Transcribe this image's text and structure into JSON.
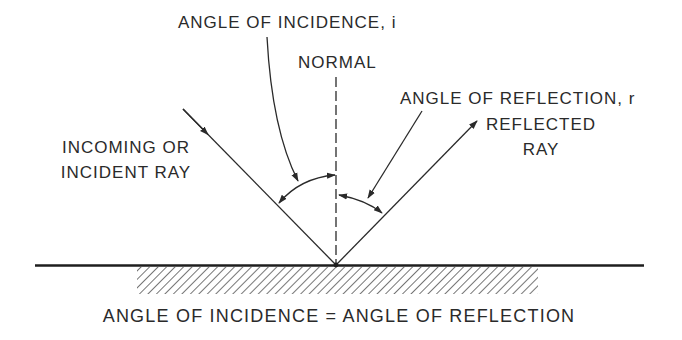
{
  "diagram": {
    "type": "law-of-reflection",
    "labels": {
      "angle_of_incidence": "ANGLE OF INCIDENCE, i",
      "normal": "NORMAL",
      "angle_of_reflection": "ANGLE OF REFLECTION, r",
      "reflected_ray_line1": "REFLECTED",
      "reflected_ray_line2": "RAY",
      "incident_ray_line1": "INCOMING OR",
      "incident_ray_line2": "INCIDENT RAY",
      "caption": "ANGLE OF INCIDENCE = ANGLE OF REFLECTION"
    },
    "elements": [
      {
        "id": "reflecting-surface",
        "kind": "line"
      },
      {
        "id": "hatched-medium",
        "kind": "hatch"
      },
      {
        "id": "normal",
        "kind": "dashed-line"
      },
      {
        "id": "incident-ray",
        "kind": "arrow-line"
      },
      {
        "id": "reflected-ray",
        "kind": "arrow-line"
      },
      {
        "id": "incidence-angle-arc",
        "kind": "double-arrow-arc"
      },
      {
        "id": "reflection-angle-arc",
        "kind": "double-arrow-arc"
      },
      {
        "id": "incidence-pointer",
        "kind": "leader-arrow"
      },
      {
        "id": "reflection-pointer",
        "kind": "leader-arrow"
      }
    ],
    "colors": {
      "ink": "#2a2a2a",
      "background": "#ffffff"
    }
  }
}
